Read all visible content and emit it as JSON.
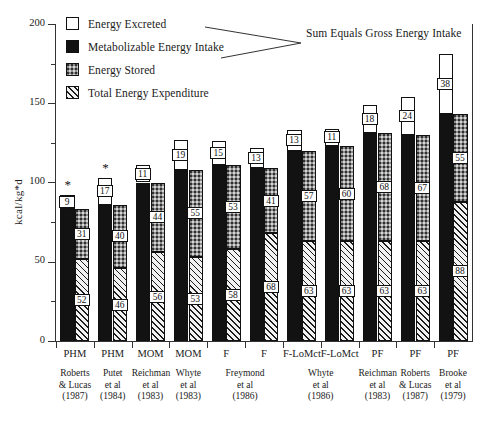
{
  "chart_data": {
    "type": "bar",
    "title": "",
    "xlabel": "",
    "ylabel": "kcal/kg*d",
    "ylim": [
      0,
      200
    ],
    "yticks": [
      0,
      50,
      100,
      150,
      200
    ],
    "yticklabels": [
      "0",
      "50",
      "100",
      "150",
      "200"
    ],
    "grid": false,
    "legend_position": "upper-left-inside",
    "annotation": "Sum Equals Gross Energy Intake",
    "series": [
      {
        "name": "Energy Excreted",
        "values": [
          9,
          17,
          11,
          19,
          15,
          13,
          13,
          11,
          18,
          24,
          38
        ]
      },
      {
        "name": "Metabolizable Energy Intake",
        "values": [
          83,
          86,
          100,
          108,
          111,
          109,
          120,
          123,
          131,
          130,
          143
        ]
      },
      {
        "name": "Energy Stored",
        "values": [
          31,
          40,
          44,
          55,
          53,
          41,
          57,
          60,
          68,
          67,
          55
        ]
      },
      {
        "name": "Total Energy Expenditure",
        "values": [
          52,
          46,
          56,
          53,
          58,
          68,
          63,
          63,
          63,
          63,
          88
        ]
      }
    ],
    "categories": [
      "PHM",
      "PHM",
      "MOM",
      "MOM",
      "F",
      "F",
      "F-LoMct",
      "F-LoMct",
      "PF",
      "PF",
      "PF"
    ],
    "sources": [
      "Roberts\n& Lucas\n(1987)",
      "Putet\net al\n(1984)",
      "Reichman\net al\n(1983)",
      "Whyte\net al\n(1983)",
      "Freymond\net al\n(1986)",
      "Whyte\net al\n(1986)",
      "Reichman\net al\n(1983)",
      "Roberts\n& Lucas\n(1987)",
      "Brooke\net al\n(1979)"
    ],
    "source_spans": [
      1,
      1,
      1,
      1,
      2,
      2,
      1,
      1,
      1
    ],
    "significance_markers": [
      {
        "group": 1,
        "symbol": "*"
      },
      {
        "group": 2,
        "symbol": "*"
      }
    ]
  },
  "legend": {
    "items": [
      {
        "label": "Energy Excreted",
        "swatch": "white-fill"
      },
      {
        "label": "Metabolizable Energy Intake",
        "swatch": "black-fill"
      },
      {
        "label": "Energy Stored",
        "swatch": "gray-stipple-fill"
      },
      {
        "label": "Total Energy Expenditure",
        "swatch": "diagonal-hatch-fill"
      }
    ]
  },
  "axis": {
    "y_label": "kcal/kg*d",
    "y_tick_200": "200",
    "y_tick_150": "150",
    "y_tick_100": "100",
    "y_tick_50": "50",
    "y_tick_0": "0"
  },
  "annotation": {
    "text": "Sum Equals Gross Energy Intake"
  },
  "groups": [
    {
      "cat": "PHM",
      "excreted": "9",
      "stored": "31",
      "tee": "52",
      "star": "*"
    },
    {
      "cat": "PHM",
      "excreted": "17",
      "stored": "40",
      "tee": "46",
      "star": "*"
    },
    {
      "cat": "MOM",
      "excreted": "11",
      "stored": "44",
      "tee": "56",
      "star": ""
    },
    {
      "cat": "MOM",
      "excreted": "19",
      "stored": "55",
      "tee": "53",
      "star": ""
    },
    {
      "cat": "F",
      "excreted": "15",
      "stored": "53",
      "tee": "58",
      "star": ""
    },
    {
      "cat": "F",
      "excreted": "13",
      "stored": "41",
      "tee": "68",
      "star": ""
    },
    {
      "cat": "F-LoMct",
      "excreted": "13",
      "stored": "57",
      "tee": "63",
      "star": ""
    },
    {
      "cat": "F-LoMct",
      "excreted": "11",
      "stored": "60",
      "tee": "63",
      "star": ""
    },
    {
      "cat": "PF",
      "excreted": "18",
      "stored": "68",
      "tee": "63",
      "star": ""
    },
    {
      "cat": "PF",
      "excreted": "24",
      "stored": "67",
      "tee": "63",
      "star": ""
    },
    {
      "cat": "PF",
      "excreted": "38",
      "stored": "55",
      "tee": "88",
      "star": ""
    }
  ],
  "sources": [
    {
      "text": "Roberts\n& Lucas\n(1987)"
    },
    {
      "text": "Putet\net al\n(1984)"
    },
    {
      "text": "Reichman\net al\n(1983)"
    },
    {
      "text": "Whyte\net al\n(1983)"
    },
    {
      "text": "Freymond\net al\n(1986)"
    },
    {
      "text": "Whyte\net al\n(1986)"
    },
    {
      "text": "Reichman\net al\n(1983)"
    },
    {
      "text": "Roberts\n& Lucas\n(1987)"
    },
    {
      "text": "Brooke\net al\n(1979)"
    }
  ]
}
